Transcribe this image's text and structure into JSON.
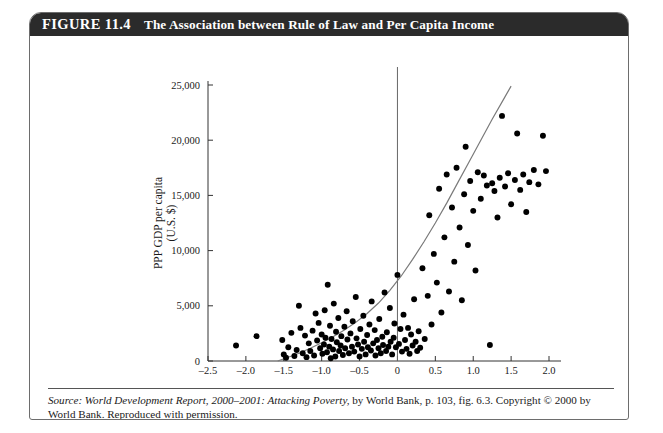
{
  "figure": {
    "number_label": "FIGURE 11.4",
    "title": "The Association between Rule of Law and Per Capita Income"
  },
  "source": {
    "lead": "Source:",
    "italic_part": " World Development Report, 2000–2001: Attacking Poverty,",
    "rest": " by World Bank, p. 103, fig. 6.3. Copyright © 2000 by World Bank. Reproduced with permission."
  },
  "chart_data": {
    "type": "scatter",
    "title": "The Association between Rule of Law and Per Capita Income",
    "xlabel": "Rule of law index",
    "ylabel": "PPP GDP per capita (U.S. $)",
    "ylabel_line1": "PPP GDP per capita",
    "ylabel_line2": "(U.S. $)",
    "xlim": [
      -2.5,
      2.0
    ],
    "ylim": [
      0,
      25000
    ],
    "xticks": [
      -2.5,
      -2.0,
      -1.5,
      -1.0,
      -0.5,
      0,
      0.5,
      1.0,
      1.5,
      2.0
    ],
    "xtick_labels": [
      "–2.5",
      "–2.0",
      "–1.5",
      "–1.0",
      "–0.5",
      "0",
      "0.5",
      "1.0",
      "1.5",
      "2.0"
    ],
    "yticks": [
      0,
      5000,
      10000,
      15000,
      20000,
      25000
    ],
    "ytick_labels": [
      "0",
      "5,000",
      "10,000",
      "15,000",
      "20,000",
      "25,000"
    ],
    "grid": false,
    "legend": null,
    "marker": {
      "shape": "circle",
      "color": "#000000",
      "size": 4
    },
    "reference_line": {
      "orientation": "vertical",
      "x": 0,
      "color": "#666666"
    },
    "fit_curve": {
      "kind": "exponential",
      "color": "#7a7a7a",
      "points": [
        [
          -1.58,
          0
        ],
        [
          -1.45,
          320
        ],
        [
          -1.3,
          700
        ],
        [
          -1.15,
          1150
        ],
        [
          -1.0,
          1650
        ],
        [
          -0.85,
          2200
        ],
        [
          -0.7,
          2800
        ],
        [
          -0.55,
          3500
        ],
        [
          -0.4,
          4300
        ],
        [
          -0.25,
          5250
        ],
        [
          -0.1,
          6400
        ],
        [
          0.05,
          7700
        ],
        [
          0.2,
          9200
        ],
        [
          0.35,
          10800
        ],
        [
          0.5,
          12500
        ],
        [
          0.65,
          14300
        ],
        [
          0.8,
          16200
        ],
        [
          0.95,
          18100
        ],
        [
          1.1,
          20000
        ],
        [
          1.25,
          21900
        ],
        [
          1.4,
          23700
        ],
        [
          1.5,
          24900
        ]
      ]
    },
    "points": [
      [
        -2.13,
        1400
      ],
      [
        -1.86,
        2250
      ],
      [
        -1.52,
        1900
      ],
      [
        -1.5,
        600
      ],
      [
        -1.47,
        300
      ],
      [
        -1.44,
        1250
      ],
      [
        -1.4,
        2550
      ],
      [
        -1.36,
        450
      ],
      [
        -1.33,
        1000
      ],
      [
        -1.3,
        5000
      ],
      [
        -1.28,
        3000
      ],
      [
        -1.25,
        700
      ],
      [
        -1.22,
        2300
      ],
      [
        -1.2,
        350
      ],
      [
        -1.17,
        1600
      ],
      [
        -1.15,
        900
      ],
      [
        -1.12,
        2750
      ],
      [
        -1.1,
        500
      ],
      [
        -1.08,
        4300
      ],
      [
        -1.06,
        1850
      ],
      [
        -1.04,
        3450
      ],
      [
        -1.02,
        1150
      ],
      [
        -1.0,
        2400
      ],
      [
        -0.99,
        650
      ],
      [
        -0.97,
        1500
      ],
      [
        -0.96,
        4600
      ],
      [
        -0.95,
        2100
      ],
      [
        -0.93,
        800
      ],
      [
        -0.92,
        6900
      ],
      [
        -0.9,
        1300
      ],
      [
        -0.89,
        3200
      ],
      [
        -0.88,
        250
      ],
      [
        -0.87,
        2000
      ],
      [
        -0.85,
        1050
      ],
      [
        -0.84,
        5200
      ],
      [
        -0.82,
        400
      ],
      [
        -0.81,
        2650
      ],
      [
        -0.8,
        1700
      ],
      [
        -0.78,
        3900
      ],
      [
        -0.77,
        900
      ],
      [
        -0.75,
        1400
      ],
      [
        -0.74,
        2250
      ],
      [
        -0.72,
        550
      ],
      [
        -0.7,
        3100
      ],
      [
        -0.69,
        1150
      ],
      [
        -0.67,
        4500
      ],
      [
        -0.66,
        1950
      ],
      [
        -0.64,
        700
      ],
      [
        -0.62,
        2500
      ],
      [
        -0.6,
        1300
      ],
      [
        -0.59,
        3600
      ],
      [
        -0.57,
        850
      ],
      [
        -0.55,
        5800
      ],
      [
        -0.54,
        2050
      ],
      [
        -0.52,
        1500
      ],
      [
        -0.5,
        400
      ],
      [
        -0.49,
        2900
      ],
      [
        -0.47,
        1100
      ],
      [
        -0.45,
        4100
      ],
      [
        -0.44,
        1750
      ],
      [
        -0.42,
        600
      ],
      [
        -0.4,
        2350
      ],
      [
        -0.39,
        1250
      ],
      [
        -0.37,
        3300
      ],
      [
        -0.35,
        950
      ],
      [
        -0.34,
        5400
      ],
      [
        -0.32,
        1600
      ],
      [
        -0.3,
        2800
      ],
      [
        -0.29,
        500
      ],
      [
        -0.27,
        1900
      ],
      [
        -0.25,
        1150
      ],
      [
        -0.24,
        3800
      ],
      [
        -0.22,
        700
      ],
      [
        -0.2,
        2200
      ],
      [
        -0.19,
        1450
      ],
      [
        -0.17,
        6200
      ],
      [
        -0.15,
        900
      ],
      [
        -0.14,
        2600
      ],
      [
        -0.12,
        1300
      ],
      [
        -0.1,
        4800
      ],
      [
        -0.09,
        1750
      ],
      [
        -0.07,
        600
      ],
      [
        -0.05,
        2100
      ],
      [
        -0.04,
        3400
      ],
      [
        -0.02,
        1250
      ],
      [
        0.0,
        7800
      ],
      [
        0.02,
        1550
      ],
      [
        0.04,
        2900
      ],
      [
        0.06,
        850
      ],
      [
        0.08,
        4200
      ],
      [
        0.1,
        1900
      ],
      [
        0.12,
        1100
      ],
      [
        0.14,
        3000
      ],
      [
        0.16,
        650
      ],
      [
        0.18,
        2400
      ],
      [
        0.2,
        1400
      ],
      [
        0.22,
        5600
      ],
      [
        0.24,
        1750
      ],
      [
        0.26,
        900
      ],
      [
        0.28,
        2700
      ],
      [
        0.3,
        1200
      ],
      [
        0.33,
        8400
      ],
      [
        0.36,
        2000
      ],
      [
        0.4,
        5900
      ],
      [
        0.42,
        13200
      ],
      [
        0.45,
        3300
      ],
      [
        0.48,
        9700
      ],
      [
        0.52,
        7100
      ],
      [
        0.55,
        15600
      ],
      [
        0.58,
        4400
      ],
      [
        0.62,
        11200
      ],
      [
        0.65,
        16900
      ],
      [
        0.68,
        6300
      ],
      [
        0.72,
        13900
      ],
      [
        0.75,
        9000
      ],
      [
        0.78,
        17500
      ],
      [
        0.82,
        12100
      ],
      [
        0.85,
        5500
      ],
      [
        0.88,
        15100
      ],
      [
        0.9,
        19400
      ],
      [
        0.93,
        10500
      ],
      [
        0.96,
        16300
      ],
      [
        1.0,
        13600
      ],
      [
        1.03,
        8200
      ],
      [
        1.06,
        17100
      ],
      [
        1.1,
        14700
      ],
      [
        1.14,
        16800
      ],
      [
        1.18,
        15900
      ],
      [
        1.22,
        1450
      ],
      [
        1.25,
        16100
      ],
      [
        1.28,
        15400
      ],
      [
        1.32,
        13000
      ],
      [
        1.35,
        16600
      ],
      [
        1.38,
        22200
      ],
      [
        1.42,
        15800
      ],
      [
        1.46,
        17000
      ],
      [
        1.5,
        14200
      ],
      [
        1.55,
        16400
      ],
      [
        1.58,
        20600
      ],
      [
        1.62,
        15500
      ],
      [
        1.66,
        16900
      ],
      [
        1.7,
        13500
      ],
      [
        1.74,
        16200
      ],
      [
        1.8,
        17300
      ],
      [
        1.86,
        16000
      ],
      [
        1.92,
        20400
      ],
      [
        1.96,
        17200
      ]
    ]
  }
}
